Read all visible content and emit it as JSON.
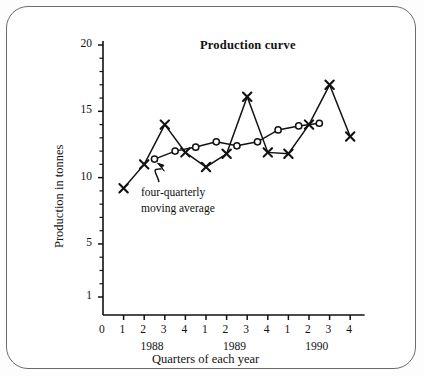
{
  "figure": {
    "title": "Production curve",
    "xaxis_title": "Quarters of each year",
    "yaxis_title": "Production in tonnes",
    "annotation": {
      "line1": "four-quarterly",
      "line2": "moving average"
    },
    "frame_color": "#6b6b6b",
    "line_color": "#111111"
  },
  "chart_data": {
    "type": "line",
    "title": "Production curve",
    "xlabel": "Quarters of each year",
    "ylabel": "Production in tonnes",
    "xlim": [
      0,
      13
    ],
    "ylim": [
      0,
      20
    ],
    "grid": false,
    "legend": "none",
    "x_tick_labels": [
      "0",
      "1",
      "2",
      "3",
      "4",
      "1",
      "2",
      "3",
      "4",
      "1",
      "2",
      "3",
      "4"
    ],
    "x_tick_values": [
      0,
      1,
      2,
      3,
      4,
      5,
      6,
      7,
      8,
      9,
      10,
      11,
      12
    ],
    "y_tick_labels": [
      "1",
      "5",
      "10",
      "15",
      "20"
    ],
    "y_tick_values": [
      1,
      5,
      10,
      15,
      20
    ],
    "y_minor_ticks": [
      2,
      3,
      4,
      6,
      7,
      8,
      9,
      11,
      12,
      13,
      14,
      16,
      17,
      18,
      19
    ],
    "group_labels": [
      {
        "label": "1988",
        "center_x": 2.5
      },
      {
        "label": "1989",
        "center_x": 6.5
      },
      {
        "label": "1990",
        "center_x": 10.5
      }
    ],
    "series": [
      {
        "name": "Production curve",
        "marker": "x",
        "x": [
          1,
          2,
          3,
          4,
          5,
          6,
          7,
          8,
          9,
          10,
          11,
          12
        ],
        "values": [
          9.2,
          11.0,
          14.0,
          11.9,
          10.8,
          11.8,
          16.1,
          11.9,
          11.8,
          14.0,
          17.0,
          13.1
        ]
      },
      {
        "name": "four-quarterly moving average",
        "marker": "o",
        "x": [
          2.5,
          3.5,
          4.5,
          5.5,
          6.5,
          7.5,
          8.5,
          9.5,
          10.5
        ],
        "values": [
          11.4,
          12.0,
          12.3,
          12.7,
          12.4,
          12.7,
          13.6,
          13.9,
          14.1
        ]
      }
    ],
    "annotations": [
      {
        "text": "four-quarterly moving average",
        "points_to_series": "four-quarterly moving average",
        "points_to_x": 2.5,
        "points_to_y": 11.4
      }
    ]
  }
}
